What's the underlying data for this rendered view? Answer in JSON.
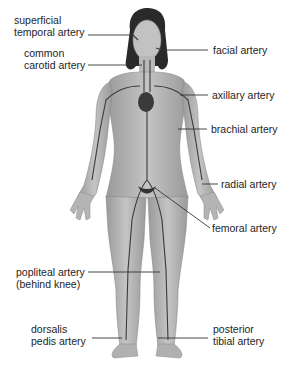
{
  "diagram": {
    "figure": "female-body-anterior-arterial-system",
    "colors": {
      "background": "#ffffff",
      "skin": "#b8b8b8",
      "skin_shadow": "#8c8c8c",
      "artery": "#3a3a3a",
      "hair": "#2a2a2a",
      "leader_line": "#333333",
      "text": "#1e1e1e"
    },
    "labels": {
      "superficial_temporal": {
        "line1": "superficial",
        "line2": "temporal artery"
      },
      "common_carotid": {
        "line1": "common",
        "line2": "carotid artery"
      },
      "facial": {
        "line1": "facial artery"
      },
      "axillary": {
        "line1": "axillary artery"
      },
      "brachial": {
        "line1": "brachial artery"
      },
      "radial": {
        "line1": "radial artery"
      },
      "femoral": {
        "line1": "femoral artery"
      },
      "popliteal": {
        "line1": "popliteal artery",
        "line2": "(behind knee)"
      },
      "dorsalis_pedis": {
        "line1": "dorsalis",
        "line2": "pedis artery"
      },
      "posterior_tibial": {
        "line1": "posterior",
        "line2": "tibial artery"
      }
    }
  }
}
